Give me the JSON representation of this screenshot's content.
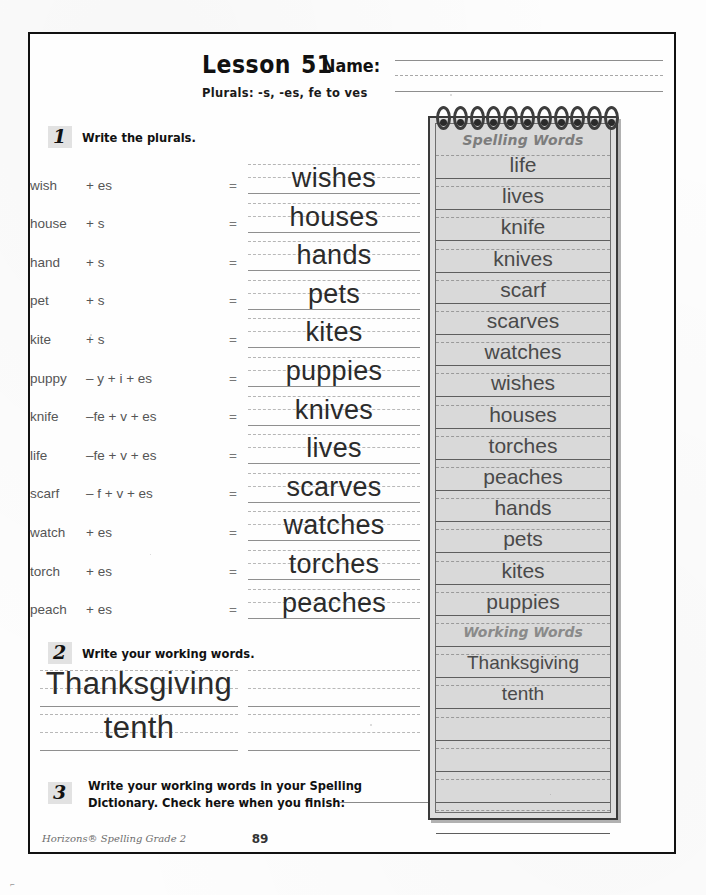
{
  "worksheet": {
    "lesson_label": "Lesson",
    "lesson_number": "51",
    "name_label": "Name:",
    "subtitle": "Plurals: -s, -es, fe to ves"
  },
  "section1": {
    "marker": "1",
    "instruction": "Write the plurals.",
    "rows": [
      {
        "word": "wish",
        "ops": "+  es",
        "equals": "=",
        "answer": "wishes"
      },
      {
        "word": "house",
        "ops": "+   s",
        "equals": "=",
        "answer": "houses"
      },
      {
        "word": "hand",
        "ops": "+   s",
        "equals": "=",
        "answer": "hands"
      },
      {
        "word": "pet",
        "ops": "+   s",
        "equals": "=",
        "answer": "pets"
      },
      {
        "word": "kite",
        "ops": "+   s",
        "equals": "=",
        "answer": "kites"
      },
      {
        "word": "puppy",
        "ops": "– y + i + es",
        "equals": "=",
        "answer": "puppies"
      },
      {
        "word": "knife",
        "ops": "–fe + v + es",
        "equals": "=",
        "answer": "knives"
      },
      {
        "word": "life",
        "ops": "–fe + v + es",
        "equals": "=",
        "answer": "lives"
      },
      {
        "word": "scarf",
        "ops": "– f + v + es",
        "equals": "=",
        "answer": "scarves"
      },
      {
        "word": "watch",
        "ops": "+  es",
        "equals": "=",
        "answer": "watches"
      },
      {
        "word": "torch",
        "ops": "+  es",
        "equals": "=",
        "answer": "torches"
      },
      {
        "word": "peach",
        "ops": "+  es",
        "equals": "=",
        "answer": "peaches"
      }
    ]
  },
  "section2": {
    "marker": "2",
    "instruction": "Write your working words.",
    "answers": [
      "Thanksgiving",
      "tenth"
    ],
    "blank_rows_right": 2
  },
  "section3": {
    "marker": "3",
    "instruction_line1": "Write your working words in your Spelling",
    "instruction_line2": "Dictionary.  Check here when you finish:"
  },
  "notebook": {
    "title": "Spelling Words",
    "spiral_rings": 11,
    "words": [
      "life",
      "lives",
      "knife",
      "knives",
      "scarf",
      "scarves",
      "watches",
      "wishes",
      "houses",
      "torches",
      "peaches",
      "hands",
      "pets",
      "kites",
      "puppies"
    ],
    "working_title": "Working Words",
    "working_words": [
      "Thanksgiving",
      "tenth"
    ],
    "blank_rows": 4
  },
  "footer": {
    "credit": "Horizons® Spelling Grade 2",
    "page_number": "89"
  },
  "colors": {
    "ink": "#2b2b2b",
    "rule_solid": "#8f8f8f",
    "rule_dash": "#b5b5b5",
    "notebook_bg": "#d9d9d9",
    "notebook_border": "#3a3a3a",
    "marker_bg": "#e2e2e2"
  }
}
